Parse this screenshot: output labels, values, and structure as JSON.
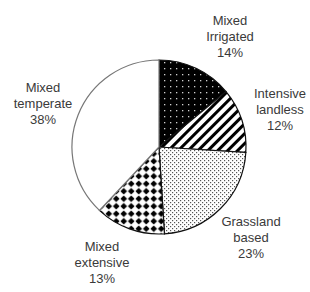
{
  "chart_data": {
    "type": "pie",
    "title": "",
    "start_angle_deg": 0,
    "direction": "clockwise",
    "slices": [
      {
        "name": "Mixed Irrigated",
        "line1": "Mixed",
        "line2": "Irrigated",
        "value": 14,
        "value_label": "14%",
        "pattern": "black-with-white-dots"
      },
      {
        "name": "Intensive landless",
        "line1": "Intensive",
        "line2": "landless",
        "value": 12,
        "value_label": "12%",
        "pattern": "diagonal-stripes"
      },
      {
        "name": "Grassland based",
        "line1": "Grassland",
        "line2": "based",
        "value": 23,
        "value_label": "23%",
        "pattern": "fine-dots"
      },
      {
        "name": "Mixed extensive",
        "line1": "Mixed",
        "line2": "extensive",
        "value": 13,
        "value_label": "13%",
        "pattern": "black-diamonds"
      },
      {
        "name": "Mixed temperate",
        "line1": "Mixed",
        "line2": "temperate",
        "value": 38,
        "value_label": "38%",
        "pattern": "none"
      }
    ],
    "categories": [
      "Mixed Irrigated",
      "Intensive landless",
      "Grassland based",
      "Mixed extensive",
      "Mixed temperate"
    ],
    "values": [
      14,
      12,
      23,
      13,
      38
    ],
    "legend": "none (direct labels)",
    "colors": {
      "outline": "#111111",
      "text": "#3a3a3a",
      "background": "#ffffff"
    }
  }
}
